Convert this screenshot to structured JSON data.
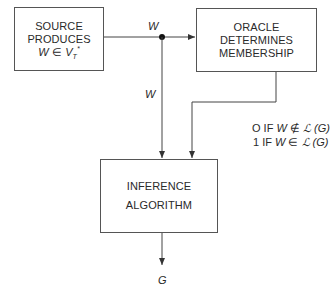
{
  "diagram": {
    "nodes": {
      "source": {
        "lines": [
          "SOURCE",
          "PRODUCES"
        ],
        "formula": {
          "var": "W",
          "rel": "∈",
          "set": "V",
          "sub": "T",
          "sup": "*"
        }
      },
      "oracle": {
        "lines": [
          "ORACLE",
          "DETERMINES",
          "MEMBERSHIP"
        ]
      },
      "inference": {
        "lines": [
          "INFERENCE",
          "ALGORITHM"
        ]
      }
    },
    "edges": {
      "source_to_oracle_label": "W",
      "source_to_inference_label": "W",
      "inference_output_label": "G"
    },
    "oracle_output": {
      "line0": {
        "value": "O IF",
        "var": "W",
        "rel": "∉",
        "lang": "ℒ",
        "arg": "(G)"
      },
      "line1": {
        "value": "1 IF",
        "var": "W",
        "rel": "∈",
        "lang": "ℒ",
        "arg": "(G)"
      }
    }
  }
}
